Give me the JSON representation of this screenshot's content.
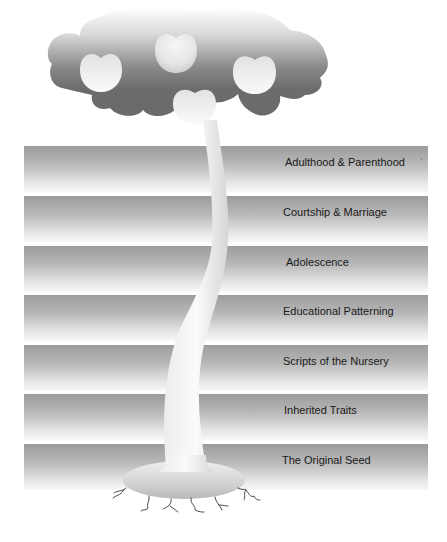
{
  "diagram": {
    "type": "tree-metaphor",
    "layers": [
      {
        "label": "Adulthood & Parenthood",
        "top": 146,
        "label_x": 261
      },
      {
        "label": "Courtship & Marriage",
        "top": 196,
        "label_x": 259
      },
      {
        "label": "Adolescence",
        "top": 246,
        "label_x": 262
      },
      {
        "label": "Educational Patterning",
        "top": 295,
        "label_x": 259
      },
      {
        "label": "Scripts of the Nursery",
        "top": 345,
        "label_x": 259
      },
      {
        "label": "Inherited Traits",
        "top": 394,
        "label_x": 260
      },
      {
        "label": "The Original Seed",
        "top": 444,
        "label_x": 258
      }
    ],
    "elements": {
      "canopy": "tree-canopy",
      "fruits": [
        "apple-left",
        "apple-top",
        "apple-right",
        "apple-bottom"
      ],
      "trunk": "tree-trunk",
      "base": "seed-base",
      "roots": "roots"
    },
    "colors": {
      "canopy_dark": "#6c6c6c",
      "band_top": "#9c9c9c",
      "band_bottom": "#f8f8f8",
      "label_text": "#1a1a1a"
    }
  }
}
